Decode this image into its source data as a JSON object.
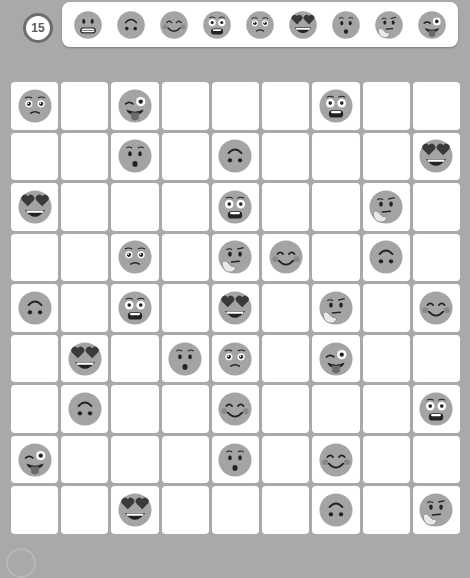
{
  "level": {
    "number": "15"
  },
  "colors": {
    "background": "#a9a9a9",
    "cell": "#ffffff",
    "face": "#a4a4a4",
    "feature": "#222222",
    "heart": "#3a3a3a"
  },
  "palette": {
    "items": [
      {
        "icon": "grimacing-face-icon",
        "label": "Grimacing"
      },
      {
        "icon": "upside-down-face-icon",
        "label": "Upside-down"
      },
      {
        "icon": "smiling-blush-face-icon",
        "label": "Smiling blush"
      },
      {
        "icon": "flushed-face-icon",
        "label": "Flushed"
      },
      {
        "icon": "holding-back-tears-face-icon",
        "label": "Holding back tears"
      },
      {
        "icon": "heart-eyes-face-icon",
        "label": "Heart eyes"
      },
      {
        "icon": "hushed-face-icon",
        "label": "Hushed"
      },
      {
        "icon": "thinking-face-icon",
        "label": "Thinking"
      },
      {
        "icon": "winking-tongue-face-icon",
        "label": "Winking tongue"
      }
    ]
  },
  "board": {
    "rows": 9,
    "cols": 9,
    "grid": [
      [
        "holding-back-tears",
        "",
        "winking-tongue",
        "",
        "",
        "",
        "flushed",
        "",
        ""
      ],
      [
        "",
        "",
        "hushed",
        "",
        "upside-down",
        "",
        "",
        "",
        "heart-eyes"
      ],
      [
        "heart-eyes",
        "",
        "",
        "",
        "flushed",
        "",
        "",
        "thinking",
        ""
      ],
      [
        "",
        "",
        "holding-back-tears",
        "",
        "thinking",
        "smiling-blush",
        "",
        "upside-down",
        ""
      ],
      [
        "upside-down",
        "",
        "flushed",
        "",
        "heart-eyes",
        "",
        "thinking",
        "",
        "smiling-blush"
      ],
      [
        "",
        "heart-eyes",
        "",
        "hushed",
        "holding-back-tears",
        "",
        "winking-tongue",
        "",
        ""
      ],
      [
        "",
        "upside-down",
        "",
        "",
        "smiling-blush",
        "",
        "",
        "",
        "flushed"
      ],
      [
        "winking-tongue",
        "",
        "",
        "",
        "hushed",
        "",
        "smiling-blush",
        "",
        ""
      ],
      [
        "",
        "",
        "heart-eyes",
        "",
        "",
        "",
        "upside-down",
        "",
        "thinking"
      ]
    ]
  }
}
